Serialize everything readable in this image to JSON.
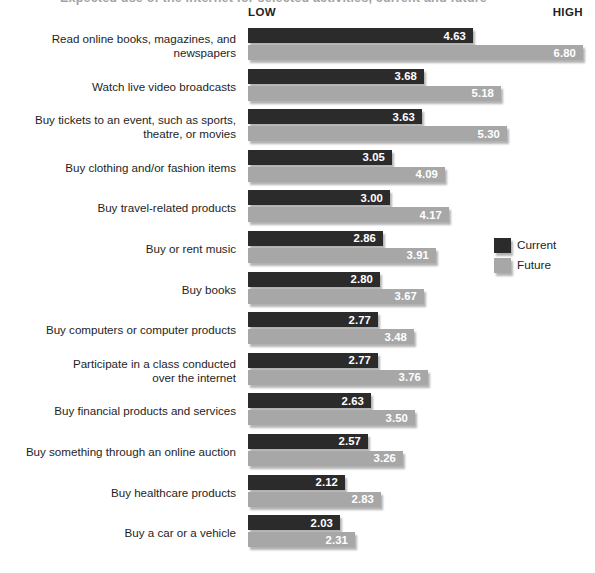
{
  "title_partial": "Expected use of the internet for selected activities, current and future",
  "axis": {
    "low_label": "LOW",
    "high_label": "HIGH"
  },
  "legend": {
    "position": "right-middle",
    "items": [
      {
        "name": "Current",
        "color": "#2b2b2b"
      },
      {
        "name": "Future",
        "color": "#a7a7a7"
      }
    ]
  },
  "chart_data": {
    "type": "bar",
    "orientation": "horizontal",
    "title": "Expected use of the internet for selected activities, current and future",
    "xlabel": "",
    "ylabel": "",
    "xlim": [
      0,
      7
    ],
    "axis_low_label": "LOW",
    "axis_high_label": "HIGH",
    "grid": false,
    "legend_position": "right",
    "categories": [
      "Read online books, magazines, and newspapers",
      "Watch live video broadcasts",
      "Buy tickets to an event, such as sports, theatre, or movies",
      "Buy clothing and/or fashion items",
      "Buy travel-related products",
      "Buy or rent music",
      "Buy books",
      "Buy computers or computer products",
      "Participate in a class conducted over the internet",
      "Buy financial products and services",
      "Buy something through an online auction",
      "Buy healthcare products",
      "Buy a car or a vehicle"
    ],
    "series": [
      {
        "name": "Current",
        "color": "#2b2b2b",
        "values": [
          4.63,
          3.68,
          3.63,
          3.05,
          3.0,
          2.86,
          2.8,
          2.77,
          2.77,
          2.63,
          2.57,
          2.12,
          2.03
        ]
      },
      {
        "name": "Future",
        "color": "#a7a7a7",
        "values": [
          6.8,
          5.18,
          5.3,
          4.09,
          4.17,
          3.91,
          3.67,
          3.48,
          3.76,
          3.5,
          3.26,
          2.83,
          2.31
        ]
      }
    ]
  },
  "rows": [
    {
      "label_lines": [
        "Read online books, magazines, and",
        "newspapers"
      ],
      "current": "4.63",
      "future": "6.80"
    },
    {
      "label_lines": [
        "Watch live video broadcasts"
      ],
      "current": "3.68",
      "future": "5.18"
    },
    {
      "label_lines": [
        "Buy tickets to an event, such as sports,",
        "theatre, or movies"
      ],
      "current": "3.63",
      "future": "5.30"
    },
    {
      "label_lines": [
        "Buy clothing and/or fashion items"
      ],
      "current": "3.05",
      "future": "4.09"
    },
    {
      "label_lines": [
        "Buy travel-related products"
      ],
      "current": "3.00",
      "future": "4.17"
    },
    {
      "label_lines": [
        "Buy or rent music"
      ],
      "current": "2.86",
      "future": "3.91"
    },
    {
      "label_lines": [
        "Buy books"
      ],
      "current": "2.80",
      "future": "3.67"
    },
    {
      "label_lines": [
        "Buy computers or computer products"
      ],
      "current": "2.77",
      "future": "3.48"
    },
    {
      "label_lines": [
        "Participate in a class conducted",
        "over the internet"
      ],
      "current": "2.77",
      "future": "3.76"
    },
    {
      "label_lines": [
        "Buy financial products and services"
      ],
      "current": "2.63",
      "future": "3.50"
    },
    {
      "label_lines": [
        "Buy something through an online auction"
      ],
      "current": "2.57",
      "future": "3.26"
    },
    {
      "label_lines": [
        "Buy healthcare products"
      ],
      "current": "2.12",
      "future": "2.83"
    },
    {
      "label_lines": [
        "Buy a car or a vehicle"
      ],
      "current": "2.03",
      "future": "2.31"
    }
  ]
}
